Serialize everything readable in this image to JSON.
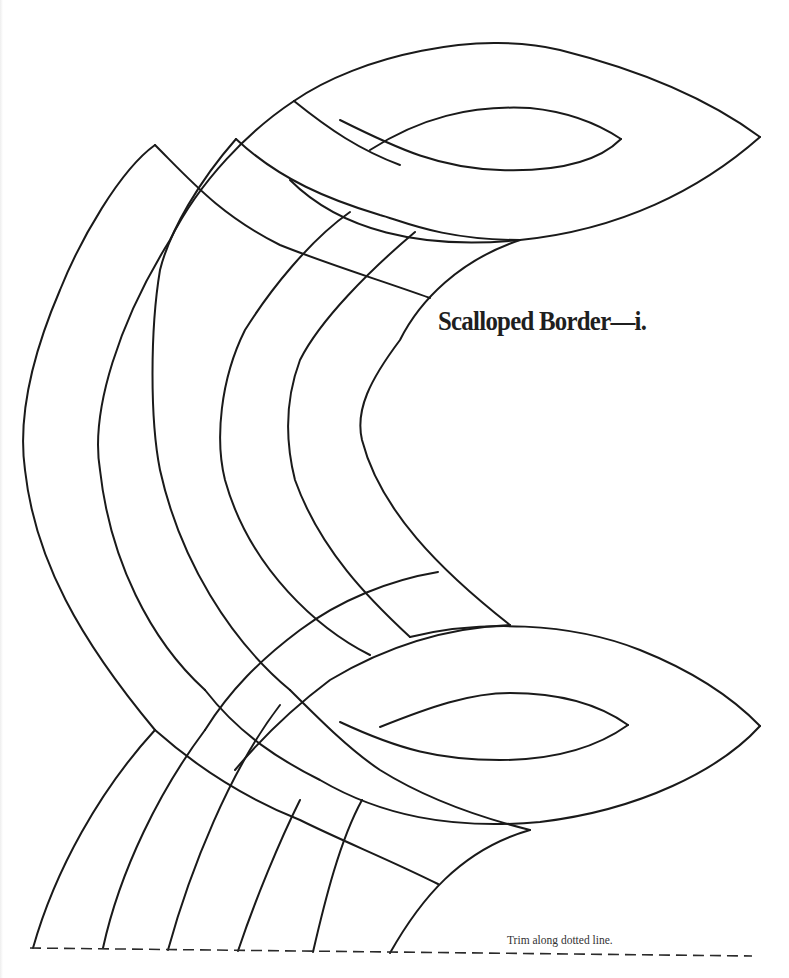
{
  "page": {
    "title": "Scalloped Border—i.",
    "caption": "Trim along dotted line.",
    "colors": {
      "ink": "#1a1a1a",
      "paper": "#ffffff"
    }
  },
  "pattern": {
    "name": "scalloped-border",
    "trim_line": {
      "x1": 30,
      "y1": 948,
      "x2": 752,
      "y2": 956
    },
    "strokes": [
      {
        "id": "upper-lobe-outer-top",
        "d": "M 294 101 C 360 55, 480 30, 560 50 C 640 70, 710 100, 760 137"
      },
      {
        "id": "upper-lobe-outer-bottom",
        "d": "M 760 137 C 700 190, 620 230, 520 240 C 420 250, 340 230, 290 180"
      },
      {
        "id": "upper-lobe-inner-top",
        "d": "M 370 150 C 420 118, 470 105, 530 108 C 570 112, 600 125, 621 139"
      },
      {
        "id": "upper-lobe-inner-bottom",
        "d": "M 621 139 C 600 160, 560 172, 500 170 C 440 168, 400 150, 340 120"
      },
      {
        "id": "upper-seam-a",
        "d": "M 294 101 C 330 130, 360 150, 400 165"
      },
      {
        "id": "upper-seam-b",
        "d": "M 236 139 C 280 180, 330 200, 380 215 C 400 220, 440 240, 520 240"
      },
      {
        "id": "upper-seam-c",
        "d": "M 155 145 C 190 180, 220 215, 280 245 C 330 265, 380 280, 430 298"
      },
      {
        "id": "peak-left",
        "d": "M 155 145 C 120 170, 80 240, 60 290 C 30 360, 18 420, 25 470 C 35 560, 80 640, 155 730"
      },
      {
        "id": "band-1",
        "d": "M 294 101 C 250 130, 200 180, 170 240 C 120 320, 90 410, 100 470 C 110 560, 150 640, 205 690"
      },
      {
        "id": "band-2",
        "d": "M 236 139 C 200 180, 170 230, 160 270 C 150 330, 150 420, 160 470 C 180 560, 230 640, 290 690"
      },
      {
        "id": "band-3",
        "d": "M 350 212 C 310 240, 270 290, 245 330 C 220 380, 215 440, 225 480 C 250 570, 320 630, 370 655"
      },
      {
        "id": "band-4",
        "d": "M 415 232 C 370 270, 320 320, 300 360 C 285 400, 285 440, 295 480 C 320 550, 370 600, 410 637"
      },
      {
        "id": "band-5",
        "d": "M 520 240 C 460 260, 420 300, 400 340 C 370 380, 355 410, 362 440 C 380 510, 440 570, 510 625"
      },
      {
        "id": "lower-seam-a",
        "d": "M 438 572 C 390 580, 340 600, 300 630 C 260 660, 230 690, 205 730"
      },
      {
        "id": "lower-seam-b",
        "d": "M 510 625 C 440 628, 380 650, 330 680 C 290 710, 260 740, 235 770"
      },
      {
        "id": "lower-lobe-outer-top",
        "d": "M 410 637 C 480 620, 570 622, 640 650 C 690 670, 730 695, 760 726"
      },
      {
        "id": "lower-lobe-outer-bottom",
        "d": "M 760 726 C 720 770, 640 810, 540 822 C 450 830, 380 815, 320 780 C 280 760, 240 735, 205 690"
      },
      {
        "id": "lower-lobe-inner-top",
        "d": "M 380 727 C 430 707, 470 693, 510 693 C 560 693, 600 705, 628 725"
      },
      {
        "id": "lower-lobe-inner-bottom",
        "d": "M 628 725 C 600 745, 560 760, 500 760 C 440 760, 400 750, 340 722"
      },
      {
        "id": "lower-seam-c",
        "d": "M 155 730 C 200 770, 250 800, 300 820 C 340 840, 390 860, 438 884"
      },
      {
        "id": "lower-seam-d",
        "d": "M 290 690 C 320 720, 350 750, 380 770 C 420 795, 470 815, 530 830"
      },
      {
        "id": "lower-band-1",
        "d": "M 155 730 C 100 790, 55 870, 33 948"
      },
      {
        "id": "lower-band-2",
        "d": "M 205 730 C 160 790, 120 870, 103 948"
      },
      {
        "id": "lower-band-3",
        "d": "M 280 705 C 230 770, 190 870, 168 950"
      },
      {
        "id": "lower-band-4",
        "d": "M 300 800 C 280 840, 255 900, 238 951"
      },
      {
        "id": "lower-band-5",
        "d": "M 362 800 C 340 840, 325 900, 313 952"
      },
      {
        "id": "lower-band-6",
        "d": "M 530 830 C 460 850, 420 900, 390 953"
      }
    ]
  }
}
